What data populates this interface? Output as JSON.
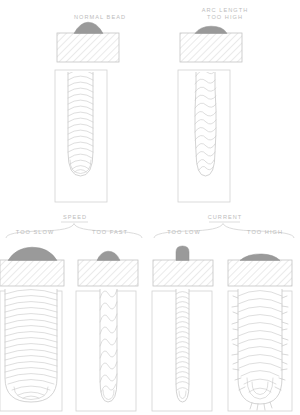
{
  "diagram": {
    "colors": {
      "bead_fill": "#9a9a9a",
      "line": "#c8c8c8",
      "hatch": "#d8d8d8",
      "text": "#bcbcbc",
      "background": "#ffffff"
    }
  },
  "top_row": {
    "panels": [
      {
        "id": "normal-bead",
        "label_lines": [
          "NORMAL BEAD"
        ]
      },
      {
        "id": "arc-length-too-high",
        "label_lines": [
          "ARC LENGTH",
          "TOO HIGH"
        ]
      }
    ]
  },
  "groups": [
    {
      "id": "speed",
      "title": "SPEED",
      "variants": [
        {
          "id": "too-slow",
          "label": "TOO SLOW"
        },
        {
          "id": "too-fast",
          "label": "TOO FAST"
        }
      ]
    },
    {
      "id": "current",
      "title": "CURRENT",
      "variants": [
        {
          "id": "too-low",
          "label": "TOO LOW"
        },
        {
          "id": "too-high",
          "label": "TOO HIGH"
        }
      ]
    }
  ],
  "bottom_row": {
    "panels": [
      {
        "id": "speed-too-slow",
        "label": "TOO SLOW"
      },
      {
        "id": "speed-too-fast",
        "label": "TOO FAST"
      },
      {
        "id": "current-too-low",
        "label": "TOO LOW"
      },
      {
        "id": "current-too-high",
        "label": "TOO HIGH"
      }
    ]
  }
}
